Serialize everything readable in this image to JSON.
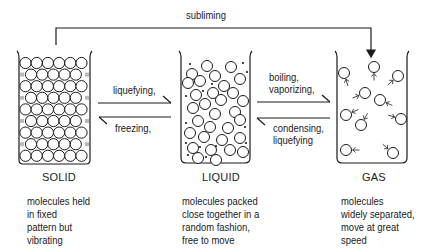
{
  "diagram": {
    "transitions": {
      "subliming": "subliming",
      "liquefying_solid": "liquefying,",
      "freezing": "freezing,",
      "boiling": "boiling,",
      "vaporizing": "vaporizing,",
      "condensing": "condensing,",
      "liquefying_gas": "liquefying"
    },
    "states": [
      {
        "name": "SOLID",
        "description": [
          "molecules held",
          "in fixed",
          "pattern but",
          "vibrating"
        ]
      },
      {
        "name": "LIQUID",
        "description": [
          "molecules packed",
          "close together in a",
          "random fashion,",
          "free to move"
        ]
      },
      {
        "name": "GAS",
        "description": [
          "molecules",
          "widely separated,",
          "move at great",
          "speed"
        ]
      }
    ],
    "colors": {
      "line": "#1a1a1a",
      "background": "#ffffff"
    }
  }
}
